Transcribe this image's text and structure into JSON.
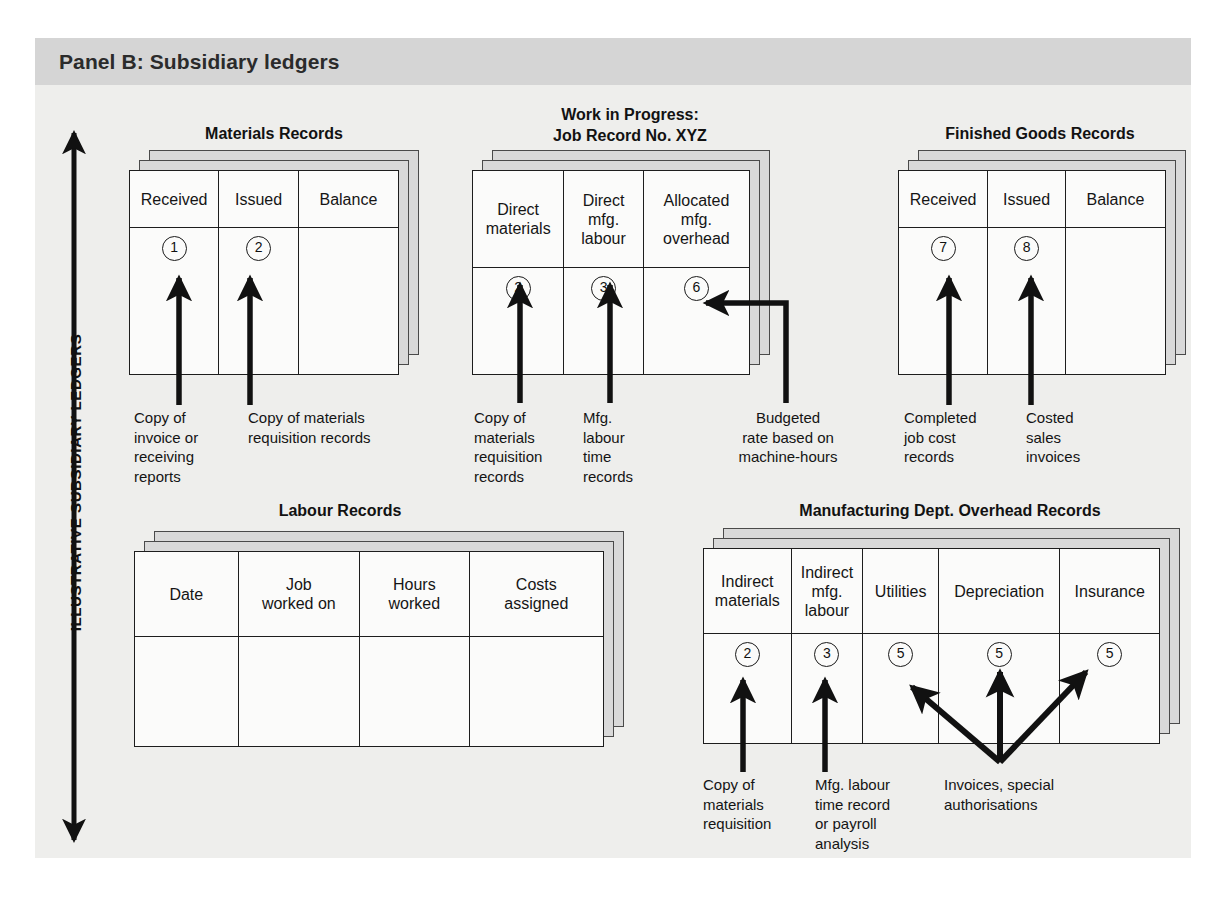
{
  "panel": {
    "title": "Panel B: Subsidiary ledgers",
    "axis_label": "ILLUSTRATIVE SUBSIDIARY LEDGERS",
    "colors": {
      "page_background": "#ffffff",
      "panel_background": "#eeeeec",
      "header_band": "#d5d5d5",
      "card_face": "#fbfbfa",
      "card_shadow_sheet": "#d9d9d9",
      "ink": "#1a1a1a"
    }
  },
  "groups": {
    "materials": {
      "title": "Materials Records",
      "columns": [
        "Received",
        "Issued",
        "Balance"
      ],
      "entries": [
        "1",
        "2",
        ""
      ],
      "captions": [
        "Copy of\ninvoice or\nreceiving\nreports",
        "Copy of materials\nrequisition records"
      ]
    },
    "wip": {
      "title_line1": "Work in Progress:",
      "title_line2": "Job Record No. XYZ",
      "columns": [
        "Direct\nmaterials",
        "Direct\nmfg.\nlabour",
        "Allocated\nmfg.\noverhead"
      ],
      "entries": [
        "2",
        "3",
        "6"
      ],
      "captions": [
        "Copy of\nmaterials\nrequisition\nrecords",
        "Mfg.\nlabour\ntime\nrecords",
        "Budgeted\nrate based on\nmachine-hours"
      ]
    },
    "finished_goods": {
      "title": "Finished Goods Records",
      "columns": [
        "Received",
        "Issued",
        "Balance"
      ],
      "entries": [
        "7",
        "8",
        ""
      ],
      "captions": [
        "Completed\njob cost\nrecords",
        "Costed\nsales\ninvoices"
      ]
    },
    "labour": {
      "title": "Labour Records",
      "columns": [
        "Date",
        "Job\nworked on",
        "Hours\nworked",
        "Costs\nassigned"
      ],
      "entries": [
        "",
        "",
        "",
        ""
      ],
      "captions": []
    },
    "overhead": {
      "title": "Manufacturing Dept. Overhead Records",
      "columns": [
        "Indirect\nmaterials",
        "Indirect\nmfg.\nlabour",
        "Utilities",
        "Depreciation",
        "Insurance"
      ],
      "entries": [
        "2",
        "3",
        "5",
        "5",
        "5"
      ],
      "captions": [
        "Copy of\nmaterials\nrequisition",
        "Mfg. labour\ntime record\nor payroll\nanalysis",
        "Invoices, special\nauthorisations"
      ]
    }
  },
  "icons": {
    "axis_arrow": "double-headed-vertical-arrow",
    "flow_arrow": "up-arrow",
    "elbow_arrow": "elbow-left-arrow",
    "fan_arrow": "three-way-fan-arrow"
  }
}
